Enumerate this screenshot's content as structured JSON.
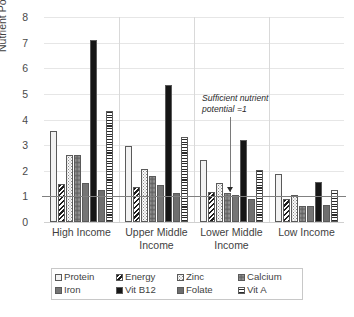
{
  "chart_data": {
    "type": "bar",
    "title": "",
    "xlabel": "",
    "ylabel": "Nutrient Potential",
    "ylim": [
      0,
      8
    ],
    "yticks": [
      0,
      1,
      2,
      3,
      4,
      5,
      6,
      7,
      8
    ],
    "grid": true,
    "legend_position": "bottom",
    "categories": [
      "High Income",
      "Upper Middle Income",
      "Lower Middle Income",
      "Low Income"
    ],
    "series": [
      {
        "name": "Protein",
        "values": [
          3.55,
          2.98,
          2.42,
          1.86
        ]
      },
      {
        "name": "Energy",
        "values": [
          1.5,
          1.36,
          1.19,
          0.9
        ]
      },
      {
        "name": "Zinc",
        "values": [
          2.61,
          2.07,
          1.53,
          1.06
        ]
      },
      {
        "name": "Calcium",
        "values": [
          2.6,
          1.8,
          1.14,
          0.63
        ]
      },
      {
        "name": "Iron",
        "values": [
          1.51,
          1.46,
          1.06,
          0.61
        ]
      },
      {
        "name": "Vit B12",
        "values": [
          7.12,
          5.36,
          3.19,
          1.57
        ]
      },
      {
        "name": "Folate",
        "values": [
          1.24,
          1.13,
          0.91,
          0.66
        ]
      },
      {
        "name": "Vit A",
        "values": [
          4.34,
          3.33,
          2.04,
          1.26
        ]
      }
    ],
    "annotations": [
      {
        "text_line1": "Sufficient nutrient",
        "text_line2": "potential =1",
        "reference_value": 1
      }
    ]
  },
  "axis": {
    "y_title": "Nutrient Potential",
    "y_tick_labels": [
      "8",
      "7",
      "6",
      "5",
      "4",
      "3",
      "2",
      "1",
      "0"
    ]
  },
  "categories": [
    {
      "line1": "High Income",
      "line2": ""
    },
    {
      "line1": "Upper Middle",
      "line2": "Income"
    },
    {
      "line1": "Lower Middle",
      "line2": "Income"
    },
    {
      "line1": "Low Income",
      "line2": ""
    }
  ],
  "legend": {
    "items": [
      {
        "label": "Protein",
        "pattern": "light-solid"
      },
      {
        "label": "Energy",
        "pattern": "diagonal-hatch"
      },
      {
        "label": "Zinc",
        "pattern": "fine-dots"
      },
      {
        "label": "Calcium",
        "pattern": "coarse-dots"
      },
      {
        "label": "Iron",
        "pattern": "mid-gray-solid"
      },
      {
        "label": "Vit B12",
        "pattern": "black-solid"
      },
      {
        "label": "Folate",
        "pattern": "dark-gray-solid"
      },
      {
        "label": "Vit A",
        "pattern": "horizontal-stripes"
      }
    ]
  },
  "annotation": {
    "line1": "Sufficient nutrient",
    "line2": "potential =1"
  },
  "colors": {
    "gridline": "#e6e6e6",
    "reference_line": "#808080",
    "bar_outline": "#5a5a5a",
    "text": "#3f3f3f"
  }
}
